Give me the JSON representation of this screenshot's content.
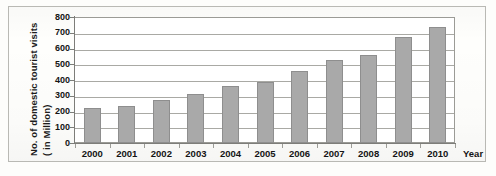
{
  "chart_data": {
    "type": "bar",
    "title": "",
    "xlabel": "Year",
    "ylabel": "No. of domestic tourist visits (in Million)",
    "ylabel_lines": [
      "No. of domestic tourist visits",
      "( in Million)"
    ],
    "categories": [
      "2000",
      "2001",
      "2002",
      "2003",
      "2004",
      "2005",
      "2006",
      "2007",
      "2008",
      "2009",
      "2010"
    ],
    "values": [
      220,
      235,
      270,
      310,
      365,
      390,
      460,
      525,
      560,
      670,
      735
    ],
    "ylim": [
      0,
      800
    ],
    "ytick_labels": [
      "800",
      "700",
      "600",
      "500",
      "400",
      "300",
      "200",
      "100",
      "0"
    ],
    "ytick_values": [
      800,
      700,
      600,
      500,
      400,
      300,
      200,
      100,
      0
    ],
    "grid": true,
    "legend": false,
    "bar_color": "#a9a9a9",
    "bar_border_color": "#8e8e8e",
    "grid_color": "#a9a9a4",
    "axis_color": "#7d7d79",
    "text_color": "#141414",
    "background": "#ffffff"
  }
}
